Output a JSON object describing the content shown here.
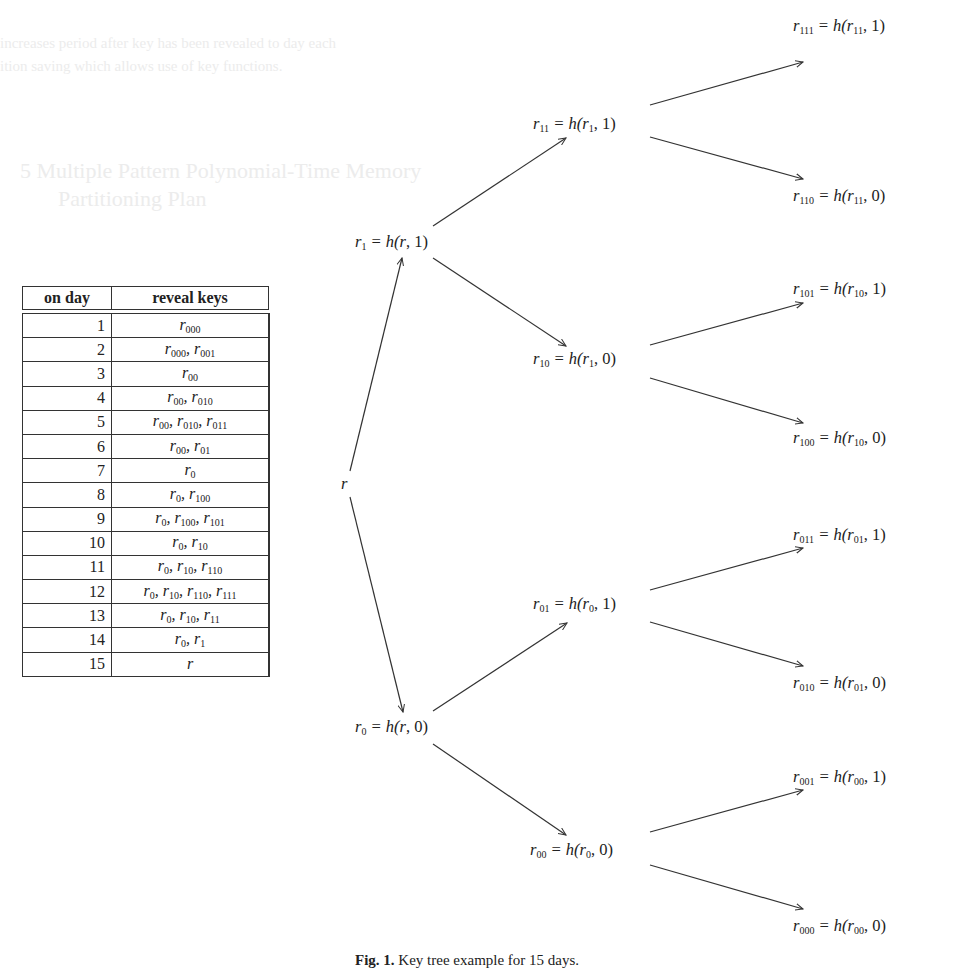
{
  "background_text": {
    "line1": "increases period after key has been revealed to day each",
    "line2": "ition saving which allows use of key functions.",
    "heading": "5  Multiple Pattern Polynomial-Time Memory",
    "heading2": "Partitioning Plan"
  },
  "table": {
    "headers": [
      "on day",
      "reveal keys"
    ],
    "rows": [
      {
        "day": "1",
        "keys": [
          "000"
        ]
      },
      {
        "day": "2",
        "keys": [
          "000",
          "001"
        ]
      },
      {
        "day": "3",
        "keys": [
          "00"
        ]
      },
      {
        "day": "4",
        "keys": [
          "00",
          "010"
        ]
      },
      {
        "day": "5",
        "keys": [
          "00",
          "010",
          "011"
        ]
      },
      {
        "day": "6",
        "keys": [
          "00",
          "01"
        ]
      },
      {
        "day": "7",
        "keys": [
          "0"
        ]
      },
      {
        "day": "8",
        "keys": [
          "0",
          "100"
        ]
      },
      {
        "day": "9",
        "keys": [
          "0",
          "100",
          "101"
        ]
      },
      {
        "day": "10",
        "keys": [
          "0",
          "10"
        ]
      },
      {
        "day": "11",
        "keys": [
          "0",
          "10",
          "110"
        ]
      },
      {
        "day": "12",
        "keys": [
          "0",
          "10",
          "110",
          "111"
        ]
      },
      {
        "day": "13",
        "keys": [
          "0",
          "10",
          "11"
        ]
      },
      {
        "day": "14",
        "keys": [
          "0",
          "1"
        ]
      },
      {
        "day": "15",
        "keys": [
          ""
        ]
      }
    ]
  },
  "tree": {
    "root": {
      "id": "",
      "label": "r"
    },
    "nodes": [
      {
        "id": "1",
        "parent": "",
        "bit": "1",
        "x": 355,
        "y": 234
      },
      {
        "id": "0",
        "parent": "",
        "bit": "0",
        "x": 355,
        "y": 719
      },
      {
        "id": "11",
        "parent": "1",
        "bit": "1",
        "x": 533,
        "y": 116
      },
      {
        "id": "10",
        "parent": "1",
        "bit": "0",
        "x": 533,
        "y": 351
      },
      {
        "id": "01",
        "parent": "0",
        "bit": "1",
        "x": 533,
        "y": 596
      },
      {
        "id": "00",
        "parent": "0",
        "bit": "0",
        "x": 530,
        "y": 842
      },
      {
        "id": "111",
        "parent": "11",
        "bit": "1",
        "x": 793,
        "y": 18
      },
      {
        "id": "110",
        "parent": "11",
        "bit": "0",
        "x": 793,
        "y": 188
      },
      {
        "id": "101",
        "parent": "10",
        "bit": "1",
        "x": 793,
        "y": 281
      },
      {
        "id": "100",
        "parent": "10",
        "bit": "0",
        "x": 793,
        "y": 430
      },
      {
        "id": "011",
        "parent": "01",
        "bit": "1",
        "x": 793,
        "y": 527
      },
      {
        "id": "010",
        "parent": "01",
        "bit": "0",
        "x": 793,
        "y": 675
      },
      {
        "id": "001",
        "parent": "00",
        "bit": "1",
        "x": 793,
        "y": 769
      },
      {
        "id": "000",
        "parent": "00",
        "bit": "0",
        "x": 793,
        "y": 918
      }
    ],
    "edges": [
      {
        "from": "r",
        "to": "r1",
        "x1": 350,
        "y1": 471,
        "x2": 402,
        "y2": 258
      },
      {
        "from": "r",
        "to": "r0",
        "x1": 350,
        "y1": 497,
        "x2": 403,
        "y2": 712
      },
      {
        "from": "r1",
        "to": "r11",
        "x1": 433,
        "y1": 226,
        "x2": 566,
        "y2": 138
      },
      {
        "from": "r1",
        "to": "r10",
        "x1": 433,
        "y1": 258,
        "x2": 566,
        "y2": 346
      },
      {
        "from": "r0",
        "to": "r01",
        "x1": 433,
        "y1": 711,
        "x2": 567,
        "y2": 623
      },
      {
        "from": "r0",
        "to": "r00",
        "x1": 433,
        "y1": 744,
        "x2": 566,
        "y2": 835
      },
      {
        "from": "r11",
        "to": "r111",
        "x1": 650,
        "y1": 105,
        "x2": 803,
        "y2": 62
      },
      {
        "from": "r11",
        "to": "r110",
        "x1": 650,
        "y1": 137,
        "x2": 803,
        "y2": 179
      },
      {
        "from": "r10",
        "to": "r101",
        "x1": 650,
        "y1": 345,
        "x2": 803,
        "y2": 303
      },
      {
        "from": "r10",
        "to": "r100",
        "x1": 650,
        "y1": 378,
        "x2": 803,
        "y2": 423
      },
      {
        "from": "r01",
        "to": "r011",
        "x1": 650,
        "y1": 590,
        "x2": 803,
        "y2": 548
      },
      {
        "from": "r01",
        "to": "r010",
        "x1": 650,
        "y1": 622,
        "x2": 803,
        "y2": 666
      },
      {
        "from": "r00",
        "to": "r001",
        "x1": 650,
        "y1": 832,
        "x2": 803,
        "y2": 790
      },
      {
        "from": "r00",
        "to": "r000",
        "x1": 650,
        "y1": 865,
        "x2": 803,
        "y2": 909
      }
    ]
  },
  "caption": {
    "label": "Fig. 1.",
    "text": "Key tree example for 15 days."
  },
  "colors": {
    "ink": "#333333",
    "ghost": "#ececec"
  }
}
